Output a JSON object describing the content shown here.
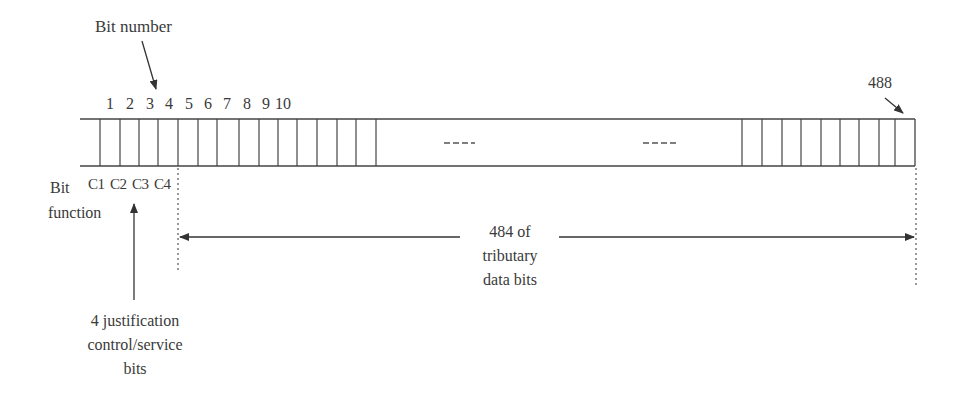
{
  "labels": {
    "bit_number": "Bit number",
    "bit_function_line1": "Bit",
    "bit_function_line2": "function",
    "last_bit": "488",
    "justification_line1": "4 justification",
    "justification_line2": "control/service",
    "justification_line3": "bits",
    "data_line1": "484 of",
    "data_line2": "tributary",
    "data_line3": "data bits",
    "ellipsis_left": "----",
    "ellipsis_right": "----"
  },
  "bit_numbers": [
    "1",
    "2",
    "3",
    "4",
    "5",
    "6",
    "7",
    "8",
    "9",
    "10"
  ],
  "bit_functions": [
    "C1",
    "C2",
    "C3",
    "C4"
  ],
  "frame": {
    "total_bits": 488,
    "control_bits": 4,
    "data_bits": 484
  },
  "colors": {
    "line": "#444444",
    "text": "#3a3a3a",
    "background": "#ffffff"
  }
}
